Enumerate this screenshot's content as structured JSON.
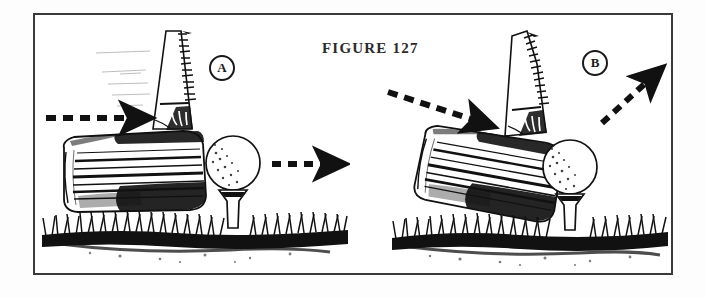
{
  "figure": {
    "caption": "FIGURE 127",
    "frame": {
      "stroke": "#3a3a3a",
      "background": "#ffffff"
    },
    "ink_color": "#111111",
    "paper_color": "#fdfdfd"
  },
  "panels": [
    {
      "id": "A",
      "badge_label": "A",
      "description": "Level swing path into ball on tee; ball launches horizontally",
      "incoming_arrow": {
        "name": "incoming-swing-path-arrow",
        "style": "dashed",
        "direction": "horizontal-right",
        "angle_deg": 0,
        "x1": 46,
        "y1": 118,
        "x2": 145,
        "y2": 118
      },
      "outgoing_arrow": {
        "name": "ball-flight-arrow",
        "style": "dashed",
        "direction": "horizontal-right",
        "angle_deg": 0,
        "x1": 272,
        "y1": 164,
        "x2": 342,
        "y2": 164
      },
      "club": {
        "name": "driver-club-head",
        "face_tilt_deg": 0,
        "score_lines": 9,
        "shaft_lean_deg": 10
      },
      "ball": {
        "cx": 233,
        "cy": 163,
        "r": 27
      },
      "tee": {
        "cx": 233,
        "top": 190,
        "bottom": 226
      },
      "turf": {
        "left": 42,
        "right": 348,
        "ground_y": 232
      }
    },
    {
      "id": "B",
      "badge_label": "B",
      "description": "Descending swing path into ball on tee; ball launches upward",
      "incoming_arrow": {
        "name": "incoming-swing-path-arrow",
        "style": "dashed",
        "direction": "down-right",
        "angle_deg": 18,
        "x1": 388,
        "y1": 92,
        "x2": 492,
        "y2": 126
      },
      "outgoing_arrow": {
        "name": "ball-flight-arrow",
        "style": "dashed",
        "direction": "up-right",
        "angle_deg": -42,
        "x1": 602,
        "y1": 123,
        "x2": 662,
        "y2": 68
      },
      "club": {
        "name": "driver-club-head",
        "face_tilt_deg": 14,
        "score_lines": 9,
        "shaft_lean_deg": 16
      },
      "ball": {
        "cx": 570,
        "cy": 167,
        "r": 27
      },
      "tee": {
        "cx": 570,
        "top": 194,
        "bottom": 228
      },
      "turf": {
        "left": 392,
        "right": 668,
        "ground_y": 234
      }
    }
  ]
}
